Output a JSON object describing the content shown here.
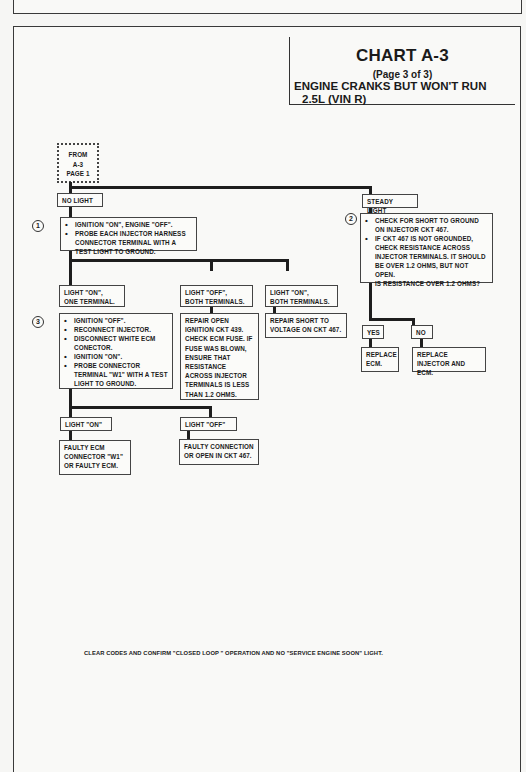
{
  "chart": {
    "title": "CHART A-3",
    "page": "(Page 3 of 3)",
    "description": "ENGINE CRANKS BUT WON'T RUN",
    "engine": "2.5L  (VIN R)"
  },
  "start_box": {
    "lines": [
      "FROM",
      "A-3",
      "PAGE 1"
    ]
  },
  "branches": {
    "no_light": {
      "label": "NO LIGHT",
      "step_number": "1",
      "instructions": [
        "IGNITION \"ON\", ENGINE \"OFF\".",
        "PROBE EACH INJECTOR HARNESS CONNECTOR TERMINAL WITH A TEST LIGHT TO GROUND."
      ]
    },
    "steady_light": {
      "label": "STEADY LIGHT",
      "step_number": "2",
      "instructions": [
        "CHECK FOR SHORT TO GROUND ON INJECTOR CKT 467.",
        "IF CKT 467 IS NOT GROUNDED, CHECK RESISTANCE ACROSS INJECTOR TERMINALS.  IT SHOULD BE OVER 1.2 OHMS, BUT NOT OPEN."
      ],
      "question": "IS RESISTANCE OVER 1.2 OHMS?",
      "yes_label": "YES",
      "no_label": "NO",
      "yes_result": "REPLACE ECM.",
      "no_result": "REPLACE INJECTOR AND ECM."
    },
    "light_on_one": {
      "label_line1": "LIGHT  \"ON\",",
      "label_line2": "ONE TERMINAL.",
      "step_number": "3",
      "instructions": [
        "IGNITION \"OFF\".",
        "RECONNECT INJECTOR.",
        "DISCONNECT WHITE ECM CONECTOR.",
        "IGNITION \"ON\".",
        "PROBE CONNECTOR TERMINAL \"W1\" WITH A TEST LIGHT TO GROUND."
      ],
      "on_label": "LIGHT \"ON\"",
      "off_label": "LIGHT \"OFF\"",
      "on_result": "FAULTY ECM CONNECTOR \"W1\" OR FAULTY ECM.",
      "off_result": "FAULTY CONNECTION OR OPEN IN CKT 467."
    },
    "light_off_both": {
      "label_line1": "LIGHT  \"OFF\",",
      "label_line2": "BOTH TERMINALS.",
      "result": "REPAIR OPEN IGNITION CKT 439. CHECK ECM FUSE. IF FUSE WAS BLOWN, ENSURE THAT RESISTANCE ACROSS INJECTOR TERMINALS IS LESS THAN 1.2 OHMS."
    },
    "light_on_both": {
      "label_line1": "LIGHT  \"ON\",",
      "label_line2": "BOTH TERMINALS.",
      "result": "REPAIR SHORT TO VOLTAGE ON CKT 467."
    }
  },
  "footer": {
    "note": "CLEAR CODES AND CONFIRM \"CLOSED LOOP \" OPERATION AND NO \"SERVICE ENGINE SOON\" LIGHT."
  }
}
